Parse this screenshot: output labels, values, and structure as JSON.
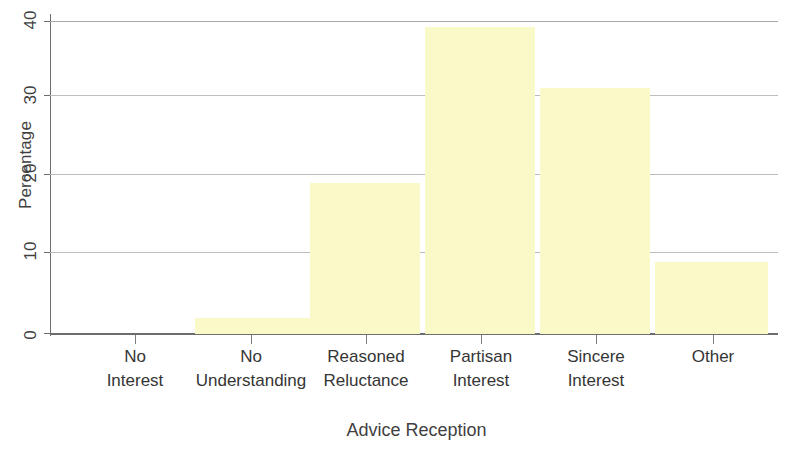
{
  "chart_data": {
    "type": "bar",
    "title": "",
    "subtitle": "",
    "xlabel": "Advice Reception",
    "ylabel": "Percentage",
    "categories": [
      "No\nInterest",
      "No\nUnderstanding",
      "Reasoned\nReluctance",
      "Partisan\nInterest",
      "Sincere\nInterest",
      "Other"
    ],
    "values": [
      0,
      2,
      19.3,
      39.2,
      31.5,
      9.2
    ],
    "ylim": [
      0,
      40
    ],
    "yticks": [
      0,
      10,
      20,
      30,
      40
    ],
    "ytick_labels": [
      "0",
      "10",
      "20",
      "30",
      "40"
    ],
    "grid": "horizontal",
    "legend": "none",
    "bar_color": "#fafac9",
    "axis_color": "#6d6d6d",
    "gridline_color": "#a9a9a9",
    "text_color": "#3a3a3a"
  }
}
